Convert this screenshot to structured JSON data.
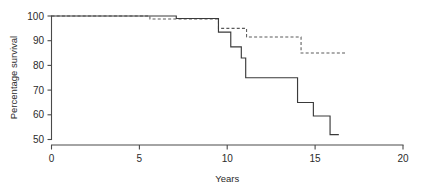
{
  "chart_data": {
    "type": "line",
    "title": "",
    "subtitle": "",
    "xlabel": "Years",
    "ylabel": "Percentage survival",
    "xlim": [
      0,
      20
    ],
    "ylim": [
      50,
      100
    ],
    "xticks": [
      0,
      5,
      10,
      15,
      20
    ],
    "yticks": [
      50,
      60,
      70,
      80,
      90,
      100
    ],
    "xtick_labels": [
      "0",
      "5",
      "10",
      "15",
      "20"
    ],
    "ytick_labels": [
      "50",
      "60",
      "70",
      "80",
      "90",
      "100"
    ],
    "grid": false,
    "legend": "none",
    "interpolation": "step-post",
    "series": [
      {
        "name": "solid-curve",
        "style": "solid",
        "color": "#3a3a3a",
        "x": [
          0.0,
          7.1,
          7.1,
          9.5,
          9.5,
          10.2,
          10.2,
          10.8,
          10.8,
          11.05,
          11.05,
          14.0,
          14.0,
          14.9,
          14.9,
          15.85,
          15.85,
          16.35
        ],
        "y": [
          100.0,
          100.0,
          99.0,
          99.0,
          93.5,
          93.5,
          87.5,
          87.5,
          83.0,
          83.0,
          75.0,
          75.0,
          65.0,
          65.0,
          59.5,
          59.5,
          52.0,
          52.0
        ]
      },
      {
        "name": "dashed-curve",
        "style": "dashed",
        "color": "#5a5a5a",
        "x": [
          0.0,
          5.6,
          5.6,
          9.5,
          9.5,
          11.1,
          11.1,
          14.2,
          14.2,
          16.8
        ],
        "y": [
          100.0,
          100.0,
          98.8,
          98.8,
          95.0,
          95.0,
          91.5,
          91.5,
          85.0,
          85.0
        ]
      }
    ]
  },
  "axes": {
    "ylabel": "Percentage survival",
    "xlabel": "Years"
  }
}
